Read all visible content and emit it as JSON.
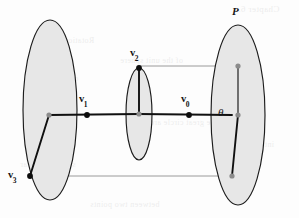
{
  "figure": {
    "kind": "geometry-diagram",
    "width": 299,
    "height": 218,
    "background_color": "#fdfdfd",
    "colors": {
      "ellipse_fill": "#e7e7e7",
      "ellipse_stroke": "#1c1c1c",
      "chain_stroke": "#101010",
      "guide_stroke": "#9a9a9a",
      "node_fill": "#8c8c8c",
      "vertex_fill": "#0d0d0d",
      "label_color": "#141414"
    }
  },
  "labels": {
    "plane_P": "P",
    "v0": "v",
    "v0_sub": "0",
    "v1": "v",
    "v1_sub": "1",
    "v2": "v",
    "v2_sub": "2",
    "v3": "v",
    "v3_sub": "3",
    "theta": "θ"
  },
  "ellipses": [
    {
      "name": "left-ellipse",
      "cx": 50,
      "cy": 110,
      "rx": 27,
      "ry": 90
    },
    {
      "name": "middle-ellipse",
      "cx": 139,
      "cy": 114,
      "rx": 13,
      "ry": 46
    },
    {
      "name": "right-ellipse",
      "cx": 238,
      "cy": 115,
      "rx": 27,
      "ry": 90
    }
  ],
  "points": [
    {
      "name": "left-hub-node",
      "x": 49,
      "y": 115,
      "style": "gray-node"
    },
    {
      "name": "v1-vertex",
      "x": 87,
      "y": 115,
      "style": "black-dot"
    },
    {
      "name": "middle-center",
      "x": 139,
      "y": 114,
      "style": "gray-node"
    },
    {
      "name": "v2-vertex",
      "x": 139,
      "y": 68,
      "style": "black-dot"
    },
    {
      "name": "v0-vertex",
      "x": 189,
      "y": 115,
      "style": "black-dot"
    },
    {
      "name": "right-center",
      "x": 238,
      "y": 115,
      "style": "gray-node"
    },
    {
      "name": "right-top-node",
      "x": 238,
      "y": 66,
      "style": "gray-node"
    },
    {
      "name": "right-bottom-node",
      "x": 232,
      "y": 176,
      "style": "gray-node"
    },
    {
      "name": "v3-vertex",
      "x": 30,
      "y": 176,
      "style": "black-dot"
    }
  ],
  "chain_segments": [
    {
      "name": "segment-hub-to-middle",
      "x1": 49,
      "y1": 115,
      "x2": 139,
      "y2": 114
    },
    {
      "name": "segment-middle-to-right",
      "x1": 139,
      "y1": 114,
      "x2": 232,
      "y2": 115
    },
    {
      "name": "segment-v2-vertical",
      "x1": 139,
      "y1": 68,
      "x2": 139,
      "y2": 114
    },
    {
      "name": "segment-hub-to-v3",
      "x1": 49,
      "y1": 115,
      "x2": 30,
      "y2": 176
    },
    {
      "name": "segment-right-diagonal",
      "x1": 238,
      "y1": 115,
      "x2": 232,
      "y2": 176
    },
    {
      "name": "segment-right-vertical",
      "x1": 238,
      "y1": 115,
      "x2": 238,
      "y2": 66
    }
  ],
  "guide_lines": [
    {
      "name": "guide-v2-to-right-top",
      "x1": 139,
      "y1": 66,
      "x2": 238,
      "y2": 66
    },
    {
      "name": "guide-v3-to-right-bottom",
      "x1": 30,
      "y1": 176,
      "x2": 232,
      "y2": 176
    }
  ],
  "label_positions": {
    "plane_P": {
      "x": 232,
      "y": 8
    },
    "v0": {
      "x": 180,
      "y": 96
    },
    "v1": {
      "x": 79,
      "y": 96
    },
    "v2": {
      "x": 129,
      "y": 50
    },
    "v3": {
      "x": 8,
      "y": 168
    },
    "theta": {
      "x": 218,
      "y": 108
    }
  },
  "bleed_through_text": [
    {
      "text": "Chapter 6.",
      "x": 238,
      "y": 4,
      "size": 9
    },
    {
      "text": "Rotations",
      "x": 60,
      "y": 36,
      "size": 8
    },
    {
      "text": "of the unit sphere",
      "x": 120,
      "y": 56,
      "size": 8
    },
    {
      "text": "quaternion",
      "x": 40,
      "y": 74,
      "size": 8
    },
    {
      "text": "the great circle arc",
      "x": 150,
      "y": 118,
      "size": 8
    },
    {
      "text": "interpolation",
      "x": 228,
      "y": 140,
      "size": 8
    },
    {
      "text": "spherical linear",
      "x": 20,
      "y": 160,
      "size": 8
    },
    {
      "text": "between two points",
      "x": 90,
      "y": 200,
      "size": 8
    }
  ]
}
